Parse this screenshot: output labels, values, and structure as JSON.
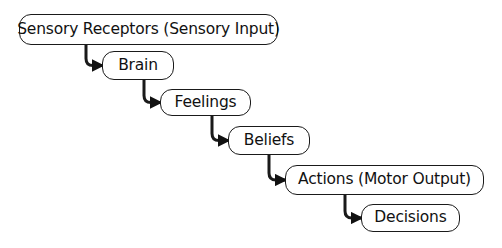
{
  "diagram": {
    "type": "flow-staircase",
    "nodes": [
      {
        "id": "sensory",
        "label": "Sensory Receptors (Sensory Input)",
        "x": 19,
        "y": 14,
        "w": 259,
        "h": 31
      },
      {
        "id": "brain",
        "label": "Brain",
        "x": 102,
        "y": 51,
        "w": 72,
        "h": 29
      },
      {
        "id": "feelings",
        "label": "Feelings",
        "x": 160,
        "y": 89,
        "w": 91,
        "h": 27
      },
      {
        "id": "beliefs",
        "label": "Beliefs",
        "x": 228,
        "y": 126,
        "w": 82,
        "h": 29
      },
      {
        "id": "actions",
        "label": "Actions (Motor Output)",
        "x": 285,
        "y": 165,
        "w": 199,
        "h": 30
      },
      {
        "id": "decisions",
        "label": "Decisions",
        "x": 361,
        "y": 204,
        "w": 99,
        "h": 28
      }
    ],
    "edges": [
      {
        "from": "sensory",
        "to": "brain"
      },
      {
        "from": "brain",
        "to": "feelings"
      },
      {
        "from": "feelings",
        "to": "beliefs"
      },
      {
        "from": "beliefs",
        "to": "actions"
      },
      {
        "from": "actions",
        "to": "decisions"
      }
    ],
    "colors": {
      "stroke": "#1a1a1a",
      "text": "#111111",
      "background": "#ffffff"
    }
  }
}
